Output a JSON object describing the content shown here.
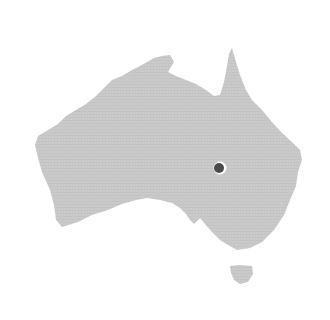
{
  "map": {
    "region": "Australia",
    "land_color": "#c9c9c9",
    "background_color": "#ffffff",
    "marker": {
      "x": 219,
      "y": 168,
      "color": "#4a4a4a",
      "halo_color": "#ffffff"
    }
  }
}
